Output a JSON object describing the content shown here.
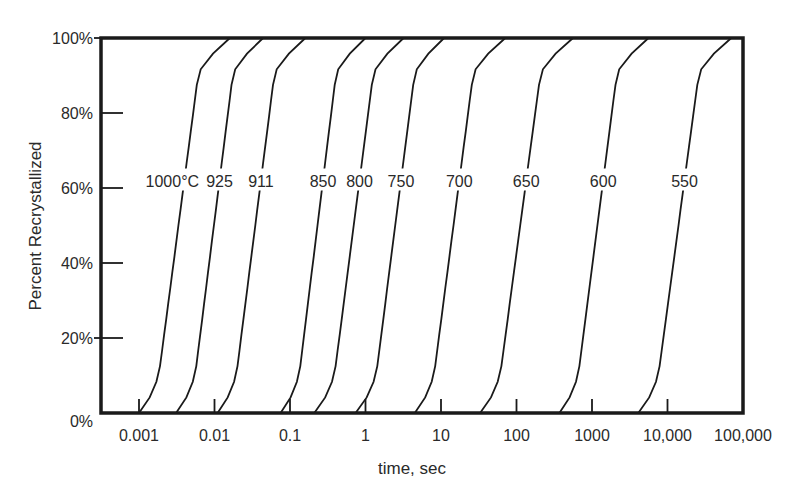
{
  "chart_data": {
    "type": "line",
    "title": "",
    "xlabel": "time, sec",
    "ylabel": "Percent Recrystallized",
    "xscale": "log",
    "xlim": [
      0.0004,
      100000
    ],
    "ylim": [
      0,
      100
    ],
    "grid": false,
    "legend": "none (curves labeled inline at ~62%)",
    "x_ticks": [
      0.001,
      0.01,
      0.1,
      1,
      10,
      100,
      1000,
      10000,
      100000
    ],
    "x_tick_labels": [
      "0.001",
      "0.01",
      "0.1",
      "1",
      "10",
      "100",
      "1000",
      "10,000",
      "100,000"
    ],
    "y_ticks": [
      0,
      20,
      40,
      60,
      80,
      100
    ],
    "y_tick_labels": [
      "0%",
      "20%",
      "40%",
      "60%",
      "80%",
      "100%"
    ],
    "series": [
      {
        "name": "1000°C",
        "label": "1000°C",
        "t_start": 0.001,
        "t_50": 0.003,
        "t_end": 0.016
      },
      {
        "name": "925",
        "label": "925",
        "t_start": 0.0031,
        "t_50": 0.0089,
        "t_end": 0.044
      },
      {
        "name": "911",
        "label": "911",
        "t_start": 0.011,
        "t_50": 0.031,
        "t_end": 0.16
      },
      {
        "name": "850",
        "label": "850",
        "t_start": 0.075,
        "t_50": 0.21,
        "t_end": 1.0
      },
      {
        "name": "800",
        "label": "800",
        "t_start": 0.21,
        "t_50": 0.64,
        "t_end": 3.2
      },
      {
        "name": "750",
        "label": "750",
        "t_start": 0.74,
        "t_50": 2.3,
        "t_end": 11
      },
      {
        "name": "700",
        "label": "700",
        "t_start": 4.5,
        "t_50": 13,
        "t_end": 71
      },
      {
        "name": "650",
        "label": "650",
        "t_start": 33,
        "t_50": 100,
        "t_end": 560
      },
      {
        "name": "600",
        "label": "600",
        "t_start": 370,
        "t_50": 1050,
        "t_end": 5600
      },
      {
        "name": "550",
        "label": "550",
        "t_start": 4100,
        "t_50": 12500,
        "t_end": 70000
      }
    ]
  },
  "axes": {
    "xlabel": "time, sec",
    "ylabel": "Percent Recrystallized"
  }
}
